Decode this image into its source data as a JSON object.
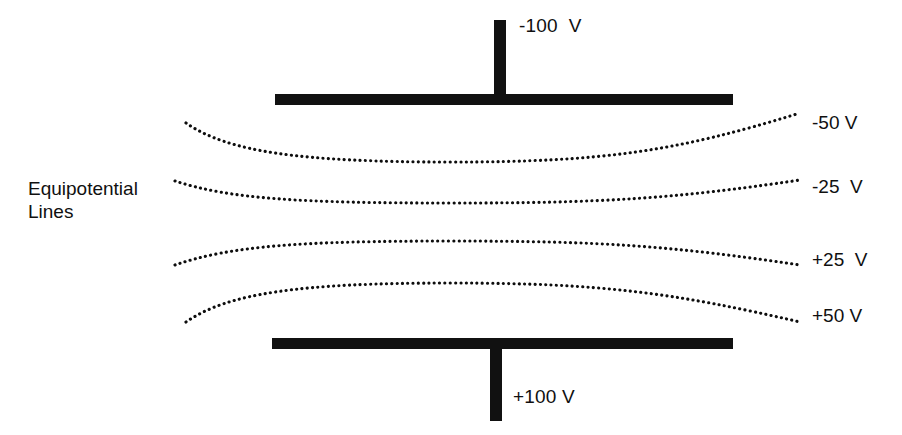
{
  "figure": {
    "background_color": "#ffffff",
    "ink_color": "#111111"
  },
  "plates": {
    "top": {
      "label": "-100  V",
      "voltage": -100,
      "unit": "V",
      "terminal_name": "top-plate-terminal"
    },
    "bottom": {
      "label": "+100 V",
      "voltage": 100,
      "unit": "V",
      "terminal_name": "bottom-plate-terminal"
    }
  },
  "annotation": {
    "equipotential_caption": "Equipotential\nLines"
  },
  "chart_data": {
    "type": "line",
    "xlabel": "",
    "ylabel": "",
    "legend_position": "right",
    "grid": false,
    "series": [
      {
        "name": "-50 V",
        "label": "-50 V",
        "voltage": -50,
        "unit": "V",
        "curvature": "concave-up",
        "path": "M 186,123 C 228,152 300,162 451,162 C 602,162 674,152 800,113"
      },
      {
        "name": "-25 V",
        "label": "-25  V",
        "voltage": -25,
        "unit": "V",
        "curvature": "concave-up",
        "path": "M 175,181 C 230,199 300,203 451,203 C 602,203 672,199 800,180"
      },
      {
        "name": "+25 V",
        "label": "+25  V",
        "voltage": 25,
        "unit": "V",
        "curvature": "concave-down",
        "path": "M 175,265 C 230,246 300,241 451,241 C 602,241 672,246 800,265"
      },
      {
        "name": "+50 V",
        "label": "+50 V",
        "voltage": 50,
        "unit": "V",
        "curvature": "concave-down",
        "path": "M 186,322 C 228,293 300,283 451,283 C 602,283 674,293 800,322"
      }
    ],
    "plate_voltages": [
      -100,
      100
    ],
    "voltage_levels": [
      -100,
      -50,
      -25,
      25,
      50,
      100
    ],
    "unit": "V"
  }
}
